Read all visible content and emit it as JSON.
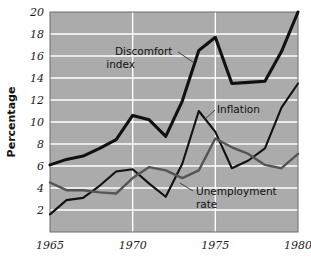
{
  "chart_data": {
    "type": "line",
    "title": "",
    "xlabel": "",
    "ylabel": "Percentage",
    "xlim": [
      1965,
      1980
    ],
    "ylim": [
      0,
      20
    ],
    "grid": true,
    "legend_position": "inline-annotations",
    "background_color": "#ababab",
    "gridline_color": "#ffffff",
    "x": [
      1965,
      1966,
      1967,
      1968,
      1969,
      1970,
      1971,
      1972,
      1973,
      1974,
      1975,
      1976,
      1977,
      1978,
      1979,
      1980
    ],
    "xticks": [
      1965,
      1970,
      1975,
      1980
    ],
    "xtick_labels": [
      "1965",
      "1970",
      "1975",
      "1980"
    ],
    "yticks": [
      2,
      4,
      6,
      8,
      10,
      12,
      14,
      16,
      18,
      20
    ],
    "ytick_labels": [
      "2",
      "4",
      "6",
      "8",
      "10",
      "12",
      "14",
      "16",
      "18",
      "20"
    ],
    "series": [
      {
        "name": "Discomfort index",
        "color": "#111111",
        "width": 3.1,
        "values": [
          6.1,
          6.6,
          6.9,
          7.6,
          8.4,
          10.6,
          10.2,
          8.7,
          11.9,
          16.5,
          17.7,
          13.5,
          13.6,
          13.7,
          16.4,
          20.0
        ]
      },
      {
        "name": "Inflation",
        "color": "#111111",
        "width": 2.1,
        "values": [
          1.6,
          2.9,
          3.1,
          4.2,
          5.5,
          5.7,
          4.4,
          3.2,
          6.2,
          11.0,
          9.1,
          5.8,
          6.5,
          7.6,
          11.3,
          13.5
        ]
      },
      {
        "name": "Unemployment rate",
        "color": "#555555",
        "width": 2.4,
        "values": [
          4.5,
          3.8,
          3.8,
          3.6,
          3.5,
          4.9,
          5.9,
          5.6,
          4.9,
          5.6,
          8.5,
          7.7,
          7.1,
          6.1,
          5.8,
          7.1
        ]
      }
    ],
    "annotations": [
      {
        "name": "discomfort-index",
        "lines": [
          "Discomfort",
          "index"
        ]
      },
      {
        "name": "inflation",
        "lines": [
          "Inflation"
        ]
      },
      {
        "name": "unemployment-rate",
        "lines": [
          "Unemployment",
          "rate"
        ]
      }
    ]
  }
}
